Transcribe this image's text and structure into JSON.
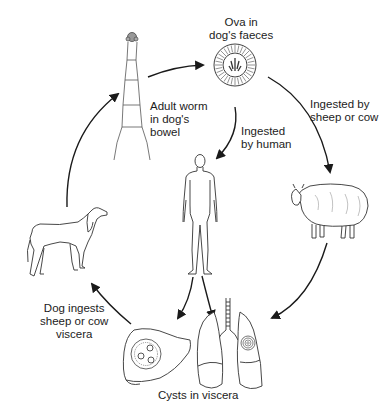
{
  "diagram": {
    "type": "cycle",
    "colors": {
      "ink": "#1a1a1a",
      "background": "#ffffff"
    },
    "nodes": [
      {
        "id": "adult-worm",
        "icon": "tapeworm-icon",
        "label_lines": [
          "Adult worm",
          "in dog's",
          "bowel"
        ]
      },
      {
        "id": "ova",
        "icon": "egg-icon",
        "label_lines": [
          "Ova in",
          "dog's faeces"
        ]
      },
      {
        "id": "human",
        "icon": "human-figure-icon",
        "label_lines": []
      },
      {
        "id": "sheep",
        "icon": "sheep-icon",
        "label_lines": []
      },
      {
        "id": "viscera",
        "icon": "liver-lungs-icon",
        "label_lines": [
          "Cysts in viscera"
        ]
      },
      {
        "id": "dog",
        "icon": "dog-icon",
        "label_lines": []
      }
    ],
    "edges": [
      {
        "from": "adult-worm",
        "to": "ova",
        "label_lines": []
      },
      {
        "from": "ova",
        "to": "human",
        "label_lines": [
          "Ingested",
          "by human"
        ]
      },
      {
        "from": "ova",
        "to": "sheep",
        "label_lines": [
          "Ingested by",
          "sheep or cow"
        ]
      },
      {
        "from": "sheep",
        "to": "viscera",
        "label_lines": []
      },
      {
        "from": "human",
        "to": "viscera",
        "label_lines": []
      },
      {
        "from": "viscera",
        "to": "dog",
        "label_lines": [
          "Dog ingests",
          "sheep or cow",
          "viscera"
        ]
      },
      {
        "from": "dog",
        "to": "adult-worm",
        "label_lines": []
      }
    ]
  },
  "labels": {
    "ova": [
      "Ova in",
      "dog's faeces"
    ],
    "adult_worm": [
      "Adult worm",
      "in dog's",
      "bowel"
    ],
    "ingested_human": [
      "Ingested",
      "by human"
    ],
    "ingested_sheep": [
      "Ingested by",
      "sheep or cow"
    ],
    "dog_ingests": [
      "Dog ingests",
      "sheep or cow",
      "viscera"
    ],
    "cysts": "Cysts in viscera"
  }
}
